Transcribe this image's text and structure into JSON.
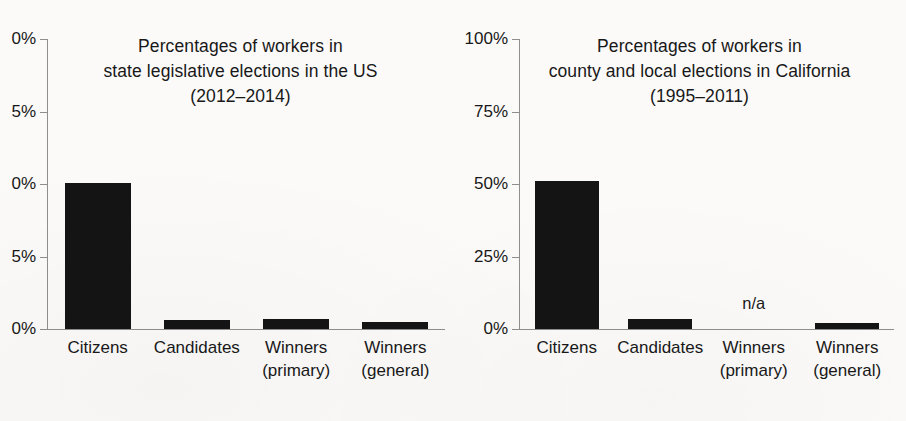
{
  "figure": {
    "background_color": "#fbfaf8",
    "bar_color": "#141414",
    "axis_color": "#8e8e8e",
    "text_color": "#181818"
  },
  "chart_data": [
    {
      "type": "bar",
      "panel": "left",
      "title": "Percentages of workers in state legislative elections in the US (2012–2014)",
      "title_lines": [
        "Percentages of workers in",
        "state legislative elections in the US",
        "(2012–2014)"
      ],
      "xlabel": "",
      "ylabel": "",
      "ylim": [
        0,
        100
      ],
      "grid": false,
      "legend": "none",
      "ytick_values": [
        100,
        75,
        50,
        25,
        0
      ],
      "ytick_labels_full": [
        "100%",
        "75%",
        "50%",
        "25%",
        "0%"
      ],
      "ytick_labels_visible": [
        "0%",
        "5%",
        "0%",
        "5%",
        "0%"
      ],
      "ytick_clipped_note": "left panel y-axis labels are cut off by the image edge",
      "categories": [
        "Citizens",
        "Candidates",
        "Winners (primary)",
        "Winners (general)"
      ],
      "category_lines": [
        [
          "Citizens"
        ],
        [
          "Candidates"
        ],
        [
          "Winners",
          "(primary)"
        ],
        [
          "Winners",
          "(general)"
        ]
      ],
      "values": [
        50.5,
        3.0,
        3.3,
        2.4
      ],
      "value_labels": [
        "",
        "",
        "",
        ""
      ]
    },
    {
      "type": "bar",
      "panel": "right",
      "title": "Percentages of workers in county and local elections in California (1995–2011)",
      "title_lines": [
        "Percentages of workers in",
        "county and local elections in California",
        "(1995–2011)"
      ],
      "xlabel": "",
      "ylabel": "",
      "ylim": [
        0,
        100
      ],
      "grid": false,
      "legend": "none",
      "ytick_values": [
        100,
        75,
        50,
        25,
        0
      ],
      "ytick_labels_full": [
        "100%",
        "75%",
        "50%",
        "25%",
        "0%"
      ],
      "ytick_labels_visible": [
        "100%",
        "75%",
        "50%",
        "25%",
        "0%"
      ],
      "categories": [
        "Citizens",
        "Candidates",
        "Winners (primary)",
        "Winners (general)"
      ],
      "category_lines": [
        [
          "Citizens"
        ],
        [
          "Candidates"
        ],
        [
          "Winners",
          "(primary)"
        ],
        [
          "Winners",
          "(general)"
        ]
      ],
      "values": [
        51.0,
        3.5,
        null,
        2.0
      ],
      "value_labels": [
        "",
        "",
        "n/a",
        ""
      ],
      "missing_label": "n/a"
    }
  ]
}
